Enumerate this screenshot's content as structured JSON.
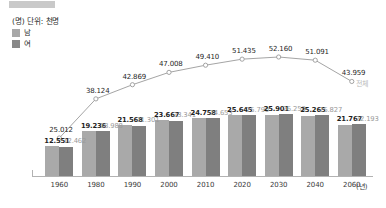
{
  "legend": {
    "unit_label": "(명) 단위: 천명",
    "items": [
      {
        "label": "남",
        "color": "#a8a8a8",
        "icon": "square-swatch"
      },
      {
        "label": "여",
        "color": "#888888",
        "icon": "square-swatch"
      }
    ]
  },
  "axis": {
    "x_unit": "(년)"
  },
  "chart_data": {
    "type": "bar",
    "title": "",
    "subtitle": "",
    "xlabel": "(년)",
    "ylabel": "(명) 단위: 천명",
    "categories": [
      "1960",
      "1980",
      "1990",
      "2000",
      "2010",
      "2020",
      "2030",
      "2040",
      "2060"
    ],
    "grid": false,
    "legend_position": "top-left",
    "ylim": [
      0,
      55000
    ],
    "series": [
      {
        "name": "남",
        "type": "bar",
        "color": "#a9a9a9",
        "values": [
          12551,
          19236,
          21568,
          23667,
          24758,
          25645,
          25901,
          25265,
          21767
        ],
        "labels": [
          "12.551",
          "19.236",
          "21.568",
          "23.667",
          "24.758",
          "25.645",
          "25.901",
          "25.265",
          "21.767"
        ]
      },
      {
        "name": "여",
        "type": "bar",
        "color": "#7f7f7f",
        "values": [
          12462,
          18988,
          21301,
          23341,
          24653,
          25790,
          26259,
          25827,
          22193
        ],
        "labels": [
          "12.462",
          "18.988",
          "21.301",
          "23.341",
          "24.653",
          "25.790",
          "26.259",
          "25.827",
          "22.193"
        ]
      },
      {
        "name": "전체",
        "type": "line",
        "color": "#9a9a9a",
        "marker": "open-circle",
        "values": [
          25012,
          38124,
          42869,
          47008,
          49410,
          51435,
          52160,
          51091,
          43959
        ],
        "labels": [
          "25.012",
          "38.124",
          "42.869",
          "47.008",
          "49.410",
          "51.435",
          "52.160",
          "51.091",
          "43.959"
        ]
      }
    ]
  }
}
